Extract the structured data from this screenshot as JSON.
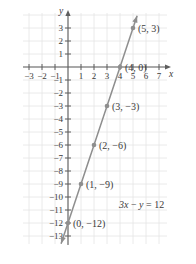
{
  "chart_data": {
    "type": "line",
    "title": "",
    "xlabel": "x",
    "ylabel": "y",
    "equation": "3x − y = 12",
    "equation_parts": {
      "a": "3",
      "x": "x",
      "minus": "−",
      "y": "y",
      "eq": "=",
      "rhs": "12"
    },
    "xlim": [
      -3.9,
      7.9
    ],
    "ylim": [
      -13.9,
      4.2
    ],
    "grid": true,
    "legend": "none",
    "line": {
      "slope": 3,
      "intercept": -12,
      "color": "#8a8a8a",
      "arrows": "both"
    },
    "x_ticks": [
      -3,
      -2,
      -1,
      1,
      2,
      3,
      4,
      5,
      6,
      7
    ],
    "x_tick_labels": [
      "−3",
      "−2",
      "−1",
      "1",
      "2",
      "3",
      "4",
      "5",
      "6",
      "7"
    ],
    "y_ticks": [
      3,
      2,
      1,
      -1,
      -2,
      -3,
      -4,
      -5,
      -6,
      -7,
      -8,
      -9,
      -10,
      -11,
      -12,
      -13
    ],
    "y_tick_labels": [
      "3",
      "2",
      "1",
      "−1",
      "−2",
      "−3",
      "−4",
      "−5",
      "−6",
      "−7",
      "−8",
      "−9",
      "−10",
      "−11",
      "−12",
      "−13"
    ],
    "points": [
      {
        "x": 5,
        "y": 3,
        "label": "(5, 3)"
      },
      {
        "x": 4,
        "y": 0,
        "label": "(4, 0)"
      },
      {
        "x": 3,
        "y": -3,
        "label": "(3, −3)"
      },
      {
        "x": 2,
        "y": -6,
        "label": "(2, −6)"
      },
      {
        "x": 1,
        "y": -9,
        "label": "(1, −9)"
      },
      {
        "x": 0,
        "y": -12,
        "label": "(0, −12)"
      }
    ]
  },
  "colors": {
    "grid": "#e4e4e4",
    "axis": "#5e5e5e",
    "line": "#8e8e8e",
    "point": "#8e8e8e",
    "text": "#3a3a3a",
    "background": "#ffffff"
  }
}
